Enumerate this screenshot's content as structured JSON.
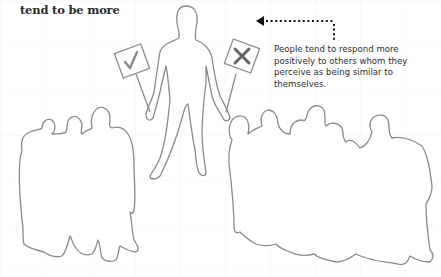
{
  "heading": "tend to be more",
  "caption": "People tend to respond more positively to others whom they perceive as being similar to themselves.",
  "illustration": {
    "central_figure": {
      "left_sign_icon": "check-mark-icon",
      "right_sign_icon": "x-mark-icon"
    },
    "left_group_count": 5,
    "right_group_count": 6,
    "arrow": "dotted-arrow-left",
    "colors": {
      "outline": "#8a8a8a",
      "sign_mark": "#777777",
      "text": "#2e2e2e",
      "arrow": "#111111"
    }
  }
}
